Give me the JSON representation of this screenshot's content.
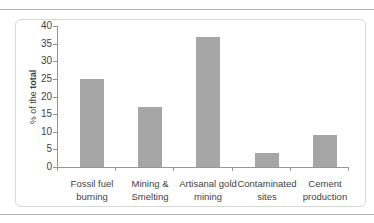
{
  "figure": {
    "bar_color": "#a6a6a6",
    "axis_color": "#969696",
    "text_color": "#3f3f3f",
    "frame_border_color": "#d9d9d9",
    "rule_color": "#b3b3b3"
  },
  "chart_data": {
    "type": "bar",
    "title": "",
    "xlabel": "",
    "ylabel": "% of the total",
    "ylabel_regular": "% of the ",
    "ylabel_bold": "total",
    "categories": [
      "Fossil fuel burning",
      "Mining & Smelting",
      "Artisanal gold mining",
      "Contaminated sites",
      "Cement production"
    ],
    "category_lines": [
      [
        "Fossil fuel",
        "burning"
      ],
      [
        "Mining &",
        "Smelting"
      ],
      [
        "Artisanal gold",
        "mining"
      ],
      [
        "Contaminated",
        "sites"
      ],
      [
        "Cement",
        "production"
      ]
    ],
    "values": [
      25,
      17,
      37,
      4,
      9
    ],
    "ylim": [
      0,
      40
    ],
    "yticks": [
      0,
      5,
      10,
      15,
      20,
      25,
      30,
      35,
      40
    ],
    "grid": false,
    "legend": "none"
  }
}
